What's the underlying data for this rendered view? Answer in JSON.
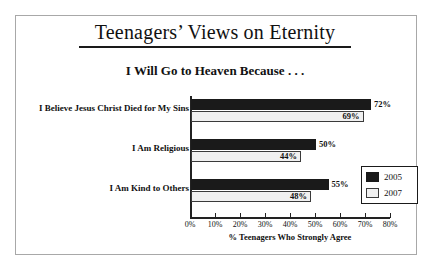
{
  "chart_data": {
    "type": "bar",
    "orientation": "horizontal",
    "title": "Teenagers’ Views on Eternity",
    "subtitle": "I Will Go to Heaven Because . . .",
    "xlabel": "% Teenagers Who Strongly Agree",
    "ylabel": "",
    "xlim": [
      0,
      80
    ],
    "grid": false,
    "legend_position": "inside-right",
    "categories": [
      "I Believe Jesus Christ Died for My Sins",
      "I Am Religious",
      "I Am Kind to Others"
    ],
    "series": [
      {
        "name": "2005",
        "color": "#1a1a1a",
        "values": [
          72,
          50,
          55
        ],
        "labels": [
          "72%",
          "50%",
          "55%"
        ]
      },
      {
        "name": "2007",
        "color": "#f0f0f0",
        "values": [
          69,
          44,
          48
        ],
        "labels": [
          "69%",
          "44%",
          "48%"
        ]
      }
    ],
    "xticks": [
      0,
      10,
      20,
      30,
      40,
      50,
      60,
      70,
      80
    ],
    "xtick_labels": [
      "0%",
      "10%",
      "20%",
      "30%",
      "40%",
      "50%",
      "60%",
      "70%",
      "80%"
    ]
  },
  "legend": {
    "entries": [
      {
        "label": "2005",
        "swatch": "black-swatch"
      },
      {
        "label": "2007",
        "swatch": "light-swatch"
      }
    ]
  },
  "colors": {
    "series_2005": "#1a1a1a",
    "series_2007": "#f0f0f0",
    "axis": "#222222",
    "frame": "#a8a8a8",
    "text": "#111111"
  }
}
